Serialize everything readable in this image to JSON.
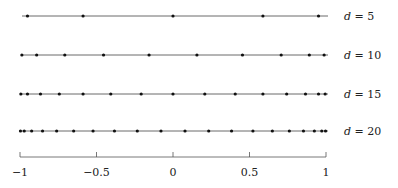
{
  "chart_data": {
    "type": "scatter",
    "title": "",
    "xlabel": "",
    "ylabel": "",
    "xlim": [
      -1,
      1
    ],
    "grid": false,
    "x_ticks": [
      -1,
      -0.5,
      0,
      0.5,
      1
    ],
    "x_tick_labels": [
      "−1",
      "−0.5",
      "0",
      "0.5",
      "1"
    ],
    "series": [
      {
        "name": "d = 5",
        "label": "d = 5",
        "n": 5,
        "values": [
          -0.9511,
          -0.5878,
          0.0,
          0.5878,
          0.9511
        ]
      },
      {
        "name": "d = 10",
        "label": "d = 10",
        "n": 10,
        "values": [
          -0.9877,
          -0.891,
          -0.7071,
          -0.454,
          -0.1564,
          0.1564,
          0.454,
          0.7071,
          0.891,
          0.9877
        ]
      },
      {
        "name": "d = 15",
        "label": "d = 15",
        "n": 15,
        "values": [
          -0.9945,
          -0.9511,
          -0.866,
          -0.7431,
          -0.5878,
          -0.4067,
          -0.2079,
          0.0,
          0.2079,
          0.4067,
          0.5878,
          0.7431,
          0.866,
          0.9511,
          0.9945
        ]
      },
      {
        "name": "d = 20",
        "label": "d = 20",
        "n": 20,
        "values": [
          -0.9969,
          -0.9724,
          -0.9239,
          -0.8526,
          -0.7604,
          -0.6494,
          -0.5225,
          -0.3827,
          -0.2334,
          -0.0785,
          0.0785,
          0.2334,
          0.3827,
          0.5225,
          0.6494,
          0.7604,
          0.8526,
          0.9239,
          0.9724,
          0.9969
        ]
      }
    ],
    "annotations": [
      "d = 5",
      "d = 10",
      "d = 15",
      "d = 20"
    ]
  }
}
